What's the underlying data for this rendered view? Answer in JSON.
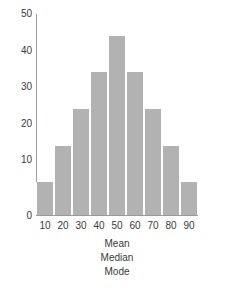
{
  "chart_data": {
    "type": "bar",
    "title": "",
    "subtitle": "",
    "xlabel": "",
    "ylabel": "",
    "categories": [
      "10",
      "20",
      "30",
      "40",
      "50",
      "60",
      "70",
      "80",
      "90"
    ],
    "values": [
      9,
      19,
      29,
      39,
      49,
      39,
      29,
      19,
      9
    ],
    "series": [
      {
        "name": "frequency",
        "values": [
          9,
          19,
          29,
          39,
          49,
          39,
          29,
          19,
          9
        ]
      }
    ],
    "ylim": [
      0,
      55
    ],
    "xlim": [
      5,
      95
    ],
    "yticks": [
      0,
      10,
      20,
      30,
      40,
      50
    ],
    "ytick_labels": [
      "0",
      "10",
      "20",
      "30",
      "40",
      "50"
    ],
    "xtick_labels": [
      "10",
      "20",
      "30",
      "40",
      "50",
      "60",
      "70",
      "80",
      "90"
    ],
    "grid": false,
    "legend": false,
    "legend_position": "none",
    "bar_color": "#b2b2b2",
    "bar_edge_color": "#ffffff",
    "axis_color": "#9a9a9a",
    "text_color": "#3a3a3a",
    "background_color": "#ffffff",
    "annotations": [
      {
        "text": "Mean",
        "at_x": "50"
      },
      {
        "text": "Median",
        "at_x": "50"
      },
      {
        "text": "Mode",
        "at_x": "50"
      }
    ]
  }
}
